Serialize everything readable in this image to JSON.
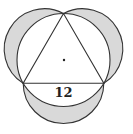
{
  "diagram": {
    "side_label": "12",
    "colors": {
      "stroke": "#333333",
      "shade": "#d9d9d9",
      "background": "#ffffff"
    },
    "has_center_dot": true
  }
}
